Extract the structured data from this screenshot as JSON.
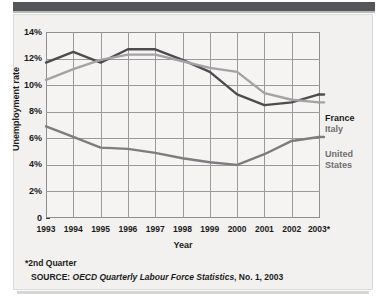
{
  "chart_data": {
    "type": "line",
    "title": "",
    "xlabel": "Year",
    "ylabel": "Unemployment rate",
    "x": [
      "1993",
      "1994",
      "1995",
      "1996",
      "1997",
      "1998",
      "1999",
      "2000",
      "2001",
      "2002",
      "2003*"
    ],
    "xtick_labels": [
      "1993",
      "1994",
      "1995",
      "1996",
      "1997",
      "1998",
      "1999",
      "2000",
      "2001",
      "2002",
      "2003*"
    ],
    "ytick_labels": [
      "14%",
      "12%",
      "10%",
      "8%",
      "6%",
      "4%",
      "2%",
      "0"
    ],
    "ytick_values": [
      14,
      12,
      10,
      8,
      6,
      4,
      2,
      0
    ],
    "ylim": [
      0,
      14
    ],
    "grid": true,
    "legend_position": "right",
    "series": [
      {
        "name": "France",
        "color": "#4d4d50",
        "values": [
          11.7,
          12.5,
          11.7,
          12.7,
          12.7,
          11.9,
          11.0,
          9.3,
          8.5,
          8.7,
          9.3
        ]
      },
      {
        "name": "Italy",
        "color": "#a3a3a5",
        "values": [
          10.4,
          11.2,
          11.9,
          12.3,
          12.3,
          11.8,
          11.3,
          11.0,
          9.4,
          8.9,
          8.7
        ]
      },
      {
        "name": "United States",
        "color": "#7d7d80",
        "values": [
          6.9,
          6.1,
          5.3,
          5.2,
          4.9,
          4.5,
          4.2,
          4.0,
          4.8,
          5.8,
          6.1
        ]
      }
    ],
    "annotations": {
      "footnote": "*2nd Quarter",
      "source_prefix": "SOURCE: ",
      "source_italic": "OECD Quarterly Labour Force Statistics",
      "source_suffix": ", No. 1, 2003"
    }
  },
  "legend": {
    "france": "France",
    "italy": "Italy",
    "united_states_line1": "United",
    "united_states_line2": "States"
  },
  "axes": {
    "x_title": "Year",
    "y_title": "Unemployment rate"
  },
  "notes": {
    "footnote": "*2nd Quarter",
    "source_prefix": "SOURCE: ",
    "source_italic": "OECD Quarterly Labour Force Statistics",
    "source_suffix": ", No. 1, 2003"
  },
  "ytick_labels": {
    "t0": "14%",
    "t1": "12%",
    "t2": "10%",
    "t3": "8%",
    "t4": "6%",
    "t5": "4%",
    "t6": "2%",
    "t7": "0"
  },
  "xtick_labels": {
    "t0": "1993",
    "t1": "1994",
    "t2": "1995",
    "t3": "1996",
    "t4": "1997",
    "t5": "1998",
    "t6": "1999",
    "t7": "2000",
    "t8": "2001",
    "t9": "2002",
    "t10": "2003*"
  },
  "colors": {
    "france": "#4d4d50",
    "italy": "#a3a3a5",
    "united_states": "#7d7d80",
    "panel_bg": "#f2f1ef",
    "banner": "#55565a",
    "grid": "#9a9a9c"
  }
}
